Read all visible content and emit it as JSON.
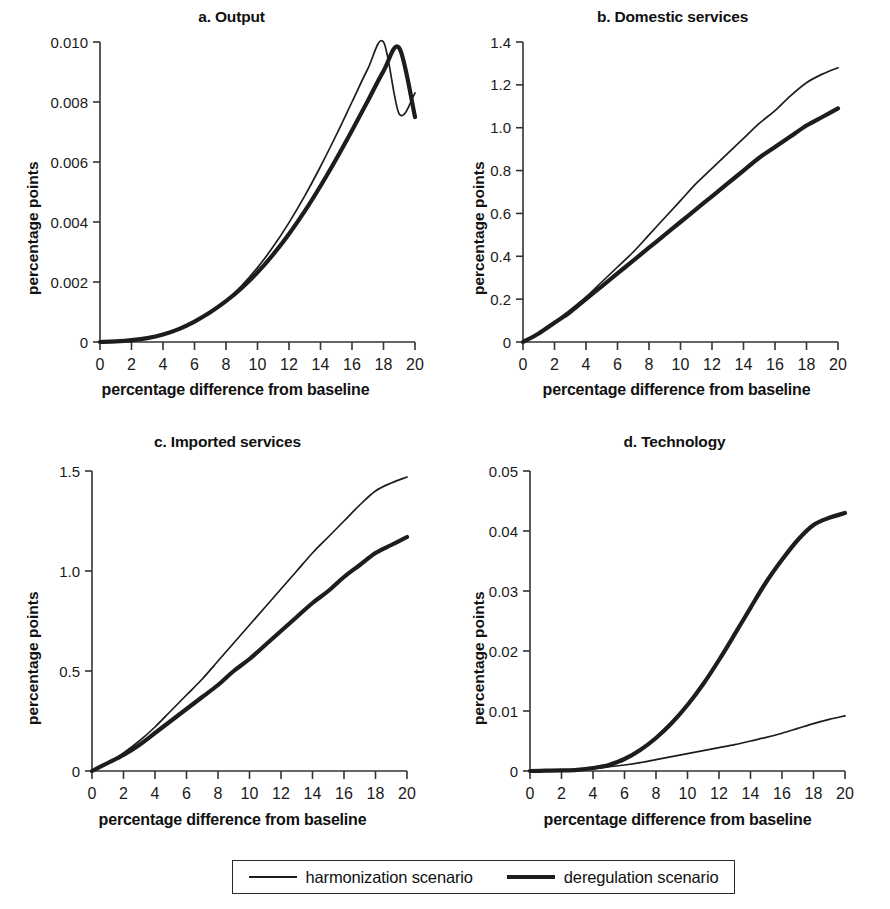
{
  "figure": {
    "xlabel": "percentage difference from baseline",
    "ylabel": "percentage points"
  },
  "legend": {
    "items": [
      {
        "label": "harmonization scenario",
        "style": "thin-line"
      },
      {
        "label": "deregulation scenario",
        "style": "thick-line"
      }
    ]
  },
  "colors": {
    "line": "#1d1d1d",
    "axis": "#333333",
    "background": "#ffffff"
  },
  "panels": [
    {
      "key": "a",
      "title": "a. Output"
    },
    {
      "key": "b",
      "title": "b. Domestic services"
    },
    {
      "key": "c",
      "title": "c. Imported services"
    },
    {
      "key": "d",
      "title": "d. Technology"
    }
  ],
  "chart_data": [
    {
      "type": "line",
      "title": "a. Output",
      "xlabel": "percentage difference from baseline",
      "ylabel": "percentage points",
      "xlim": [
        0,
        20
      ],
      "ylim": [
        0,
        0.01
      ],
      "xticks": [
        0,
        2,
        4,
        6,
        8,
        10,
        12,
        14,
        16,
        18,
        20
      ],
      "yticks": [
        0,
        0.002,
        0.004,
        0.006,
        0.008,
        0.01
      ],
      "ytick_labels": [
        "0",
        "0.002",
        "0.004",
        "0.006",
        "0.008",
        "0.010"
      ],
      "grid": false,
      "legend_position": "below figure",
      "x": [
        0,
        1,
        2,
        3,
        4,
        5,
        6,
        7,
        8,
        9,
        10,
        11,
        12,
        13,
        14,
        15,
        16,
        17,
        18,
        19,
        20
      ],
      "series": [
        {
          "name": "harmonization scenario",
          "values": [
            0,
            2e-05,
            6e-05,
            0.00013,
            0.00025,
            0.00042,
            0.00066,
            0.00098,
            0.00138,
            0.00188,
            0.00248,
            0.00318,
            0.00398,
            0.00487,
            0.00585,
            0.0069,
            0.008,
            0.0091,
            0.0101,
            0.0076,
            0.0083
          ]
        },
        {
          "name": "deregulation scenario",
          "values": [
            0,
            2e-05,
            6e-05,
            0.00013,
            0.00025,
            0.00043,
            0.00068,
            0.00099,
            0.00136,
            0.0018,
            0.00232,
            0.00292,
            0.0036,
            0.00436,
            0.0052,
            0.0061,
            0.00705,
            0.00803,
            0.00903,
            0.0098,
            0.0075
          ]
        }
      ],
      "series_endpoints": {
        "harmonization scenario": 0.0083,
        "deregulation scenario": 0.0075
      }
    },
    {
      "type": "line",
      "title": "b. Domestic services",
      "xlabel": "percentage difference from baseline",
      "ylabel": "percentage points",
      "xlim": [
        0,
        20
      ],
      "ylim": [
        0,
        1.4
      ],
      "xticks": [
        0,
        2,
        4,
        6,
        8,
        10,
        12,
        14,
        16,
        18,
        20
      ],
      "yticks": [
        0,
        0.2,
        0.4,
        0.6,
        0.8,
        1.0,
        1.2,
        1.4
      ],
      "ytick_labels": [
        "0",
        "0.2",
        "0.4",
        "0.6",
        "0.8",
        "1.0",
        "1.2",
        "1.4"
      ],
      "grid": false,
      "legend_position": "below figure",
      "x": [
        0,
        1,
        2,
        3,
        4,
        5,
        6,
        7,
        8,
        9,
        10,
        11,
        12,
        13,
        14,
        15,
        16,
        17,
        18,
        19,
        20
      ],
      "series": [
        {
          "name": "harmonization scenario",
          "values": [
            0,
            0.04,
            0.09,
            0.15,
            0.21,
            0.28,
            0.35,
            0.42,
            0.5,
            0.58,
            0.66,
            0.74,
            0.81,
            0.88,
            0.95,
            1.02,
            1.08,
            1.15,
            1.21,
            1.25,
            1.28
          ]
        },
        {
          "name": "deregulation scenario",
          "values": [
            0,
            0.04,
            0.09,
            0.14,
            0.2,
            0.26,
            0.32,
            0.38,
            0.44,
            0.5,
            0.56,
            0.62,
            0.68,
            0.74,
            0.8,
            0.86,
            0.91,
            0.96,
            1.01,
            1.05,
            1.09
          ]
        }
      ],
      "series_endpoints": {
        "harmonization scenario": 1.28,
        "deregulation scenario": 1.09
      }
    },
    {
      "type": "line",
      "title": "c. Imported services",
      "xlabel": "percentage difference from baseline",
      "ylabel": "percentage points",
      "xlim": [
        0,
        20
      ],
      "ylim": [
        0,
        1.5
      ],
      "xticks": [
        0,
        2,
        4,
        6,
        8,
        10,
        12,
        14,
        16,
        18,
        20
      ],
      "yticks": [
        0,
        0.5,
        1.0,
        1.5
      ],
      "ytick_labels": [
        "0",
        "0.5",
        "1.0",
        "1.5"
      ],
      "grid": false,
      "legend_position": "below figure",
      "x": [
        0,
        1,
        2,
        3,
        4,
        5,
        6,
        7,
        8,
        9,
        10,
        11,
        12,
        13,
        14,
        15,
        16,
        17,
        18,
        19,
        20
      ],
      "series": [
        {
          "name": "harmonization scenario",
          "values": [
            0,
            0.04,
            0.09,
            0.15,
            0.22,
            0.3,
            0.38,
            0.46,
            0.55,
            0.64,
            0.73,
            0.82,
            0.91,
            1.0,
            1.09,
            1.17,
            1.25,
            1.33,
            1.4,
            1.44,
            1.47
          ]
        },
        {
          "name": "deregulation scenario",
          "values": [
            0,
            0.04,
            0.08,
            0.13,
            0.19,
            0.25,
            0.31,
            0.37,
            0.43,
            0.5,
            0.56,
            0.63,
            0.7,
            0.77,
            0.84,
            0.9,
            0.97,
            1.03,
            1.09,
            1.13,
            1.17
          ]
        }
      ],
      "series_endpoints": {
        "harmonization scenario": 1.47,
        "deregulation scenario": 1.17
      }
    },
    {
      "type": "line",
      "title": "d. Technology",
      "xlabel": "percentage difference from baseline",
      "ylabel": "percentage points",
      "xlim": [
        0,
        20
      ],
      "ylim": [
        0,
        0.05
      ],
      "xticks": [
        0,
        2,
        4,
        6,
        8,
        10,
        12,
        14,
        16,
        18,
        20
      ],
      "yticks": [
        0,
        0.01,
        0.02,
        0.03,
        0.04,
        0.05
      ],
      "ytick_labels": [
        "0",
        "0.01",
        "0.02",
        "0.03",
        "0.04",
        "0.05"
      ],
      "grid": false,
      "legend_position": "below figure",
      "x": [
        0,
        1,
        2,
        3,
        4,
        5,
        6,
        7,
        8,
        9,
        10,
        11,
        12,
        13,
        14,
        15,
        16,
        17,
        18,
        19,
        20
      ],
      "series": [
        {
          "name": "harmonization scenario",
          "values": [
            0,
            5e-05,
            0.0001,
            0.0002,
            0.0004,
            0.0007,
            0.001,
            0.0014,
            0.0019,
            0.0024,
            0.0029,
            0.0034,
            0.0039,
            0.0044,
            0.005,
            0.0056,
            0.0063,
            0.0071,
            0.0079,
            0.0086,
            0.0092
          ]
        },
        {
          "name": "deregulation scenario",
          "values": [
            0,
            5e-05,
            0.0001,
            0.0002,
            0.0005,
            0.001,
            0.002,
            0.0035,
            0.0055,
            0.008,
            0.011,
            0.0145,
            0.0185,
            0.0228,
            0.0272,
            0.0315,
            0.0352,
            0.0385,
            0.041,
            0.0422,
            0.043
          ]
        }
      ],
      "series_endpoints": {
        "harmonization scenario": 0.0092,
        "deregulation scenario": 0.043
      }
    }
  ]
}
